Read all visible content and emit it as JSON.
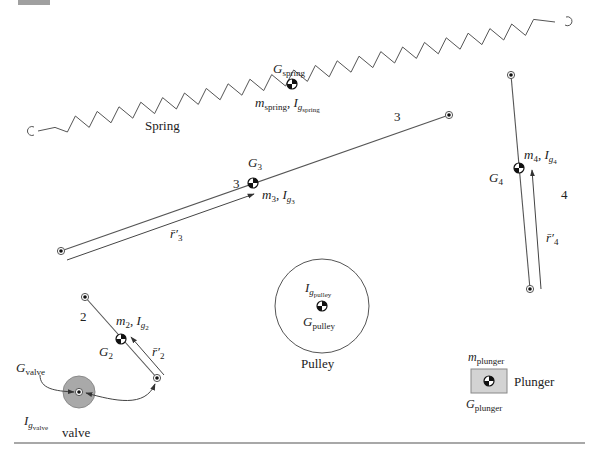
{
  "figure": {
    "corner_tab_color": "#a0a0a0",
    "rule_color": "#a8a8a8",
    "colors": {
      "line": "#555555",
      "valve_fill": "#a9a9a9",
      "valve_edge": "#888888",
      "plunger_fill": "#d3d3d3",
      "plunger_edge": "#888888",
      "cg_dark": "#111111"
    }
  },
  "spring": {
    "label": "Spring",
    "cg_label_main": "G",
    "cg_label_sub": "spring",
    "mass_label_main": "m",
    "mass_label_sub": "spring",
    "inertia_label_main": "I",
    "inertia_label_sub": "g",
    "inertia_label_subsub": "spring",
    "separator": ", "
  },
  "link3": {
    "number_label_end": "3",
    "number_label_cg": "3",
    "cg_label_main": "G",
    "cg_label_sub": "3",
    "mass_label_main": "m",
    "mass_label_sub": "3",
    "inertia_label_main": "I",
    "inertia_label_sub": "g",
    "inertia_label_subsub": "3",
    "vector_label_main": "r̄′",
    "vector_label_sub": "3"
  },
  "link4": {
    "number_label": "4",
    "cg_label_main": "G",
    "cg_label_sub": "4",
    "mass_label_main": "m",
    "mass_label_sub": "4",
    "inertia_label_main": "I",
    "inertia_label_sub": "g",
    "inertia_label_subsub": "4",
    "vector_label_main": "r̄′",
    "vector_label_sub": "4"
  },
  "link2": {
    "number_label": "2",
    "cg_label_main": "G",
    "cg_label_sub": "2",
    "mass_label_main": "m",
    "mass_label_sub": "2",
    "inertia_label_main": "I",
    "inertia_label_sub": "g",
    "inertia_label_subsub": "2",
    "vector_label_main": "r̄′",
    "vector_label_sub": "2"
  },
  "valve": {
    "label": "valve",
    "cg_label_main": "G",
    "cg_label_sub": "valve",
    "inertia_label_main": "I",
    "inertia_label_sub": "g",
    "inertia_label_subsub": "valve"
  },
  "pulley": {
    "label": "Pulley",
    "inertia_label_main": "I",
    "inertia_label_sub": "g",
    "inertia_label_subsub": "pulley",
    "cg_label_main": "G",
    "cg_label_sub": "pulley"
  },
  "plunger": {
    "label": "Plunger",
    "mass_label_main": "m",
    "mass_label_sub": "plunger",
    "cg_label_main": "G",
    "cg_label_sub": "plunger"
  },
  "icons": {
    "cg_symbol": "center-of-gravity-icon",
    "pin_joint": "pin-joint-icon",
    "spring_hook": "spring-hook-icon"
  }
}
